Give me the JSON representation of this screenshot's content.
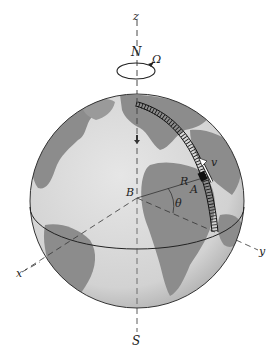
{
  "figure": {
    "type": "rotating-earth-diagram",
    "labels": {
      "z_axis": "z",
      "north_pole": "N",
      "angular_velocity": "Ω",
      "velocity": "v",
      "radius": "R",
      "point": "A",
      "center": "B",
      "angle": "θ",
      "x_axis": "x",
      "y_axis": "y",
      "south_pole": "S"
    },
    "colors": {
      "ocean": "#d9d9d9",
      "land": "#8a8a8a",
      "outline": "#333333",
      "track": "#1a1a1a",
      "background": "#ffffff"
    }
  }
}
